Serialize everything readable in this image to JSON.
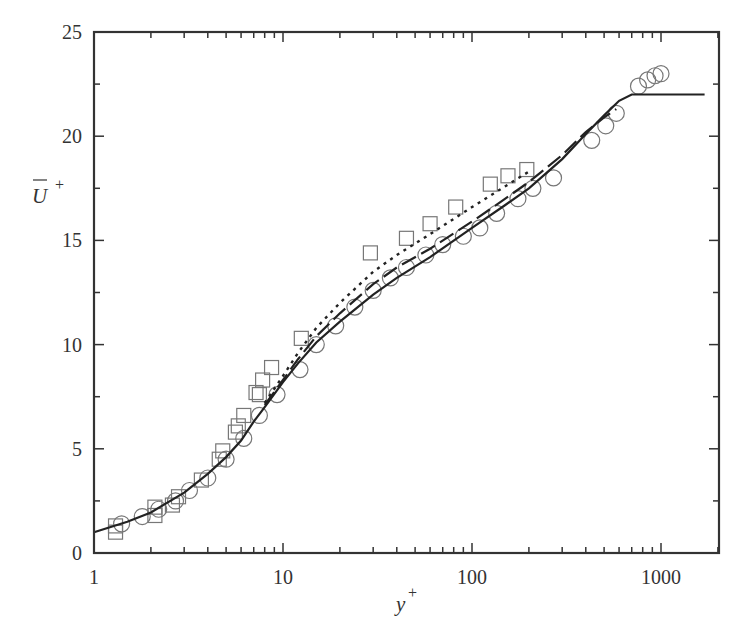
{
  "chart_data": {
    "type": "scatter",
    "title": "",
    "xlabel": "y+",
    "ylabel": "U+ (mean, overbar)",
    "x_scale": "log",
    "xlim": [
      1,
      2000
    ],
    "ylim": [
      0,
      25
    ],
    "x_ticks": [
      1,
      10,
      100,
      1000
    ],
    "x_tick_labels": [
      "1",
      "10",
      "100",
      "1000"
    ],
    "y_ticks": [
      0,
      5,
      10,
      15,
      20,
      25
    ],
    "y_tick_labels": [
      "0",
      "5",
      "10",
      "15",
      "20",
      "25"
    ],
    "grid": false,
    "legend": "none",
    "series": [
      {
        "name": "circles",
        "style": "open-circle",
        "points": [
          [
            1.4,
            1.4
          ],
          [
            1.8,
            1.75
          ],
          [
            2.2,
            2.1
          ],
          [
            2.7,
            2.5
          ],
          [
            3.2,
            3.0
          ],
          [
            4.0,
            3.6
          ],
          [
            5.0,
            4.5
          ],
          [
            6.2,
            5.5
          ],
          [
            7.5,
            6.6
          ],
          [
            9.3,
            7.6
          ],
          [
            12.3,
            8.8
          ],
          [
            15,
            10.0
          ],
          [
            19,
            10.9
          ],
          [
            24,
            11.8
          ],
          [
            30,
            12.6
          ],
          [
            37,
            13.2
          ],
          [
            45,
            13.7
          ],
          [
            57,
            14.3
          ],
          [
            70,
            14.8
          ],
          [
            90,
            15.2
          ],
          [
            110,
            15.6
          ],
          [
            135,
            16.3
          ],
          [
            175,
            17.0
          ],
          [
            210,
            17.5
          ],
          [
            270,
            18.0
          ],
          [
            430,
            19.8
          ],
          [
            510,
            20.5
          ],
          [
            580,
            21.1
          ],
          [
            760,
            22.4
          ],
          [
            850,
            22.7
          ],
          [
            930,
            22.9
          ],
          [
            1000,
            23.0
          ]
        ]
      },
      {
        "name": "squares",
        "style": "open-square",
        "points": [
          [
            1.3,
            1.0
          ],
          [
            1.3,
            1.3
          ],
          [
            2.1,
            1.8
          ],
          [
            2.1,
            2.2
          ],
          [
            2.6,
            2.3
          ],
          [
            2.8,
            2.7
          ],
          [
            3.7,
            3.5
          ],
          [
            4.6,
            4.5
          ],
          [
            4.8,
            4.9
          ],
          [
            5.6,
            5.8
          ],
          [
            5.8,
            6.1
          ],
          [
            6.2,
            6.6
          ],
          [
            7.2,
            7.7
          ],
          [
            7.5,
            7.6
          ],
          [
            7.8,
            8.3
          ],
          [
            8.7,
            8.9
          ],
          [
            12.5,
            10.3
          ],
          [
            29,
            14.4
          ],
          [
            45,
            15.1
          ],
          [
            60,
            15.8
          ],
          [
            82,
            16.6
          ],
          [
            125,
            17.7
          ],
          [
            155,
            18.1
          ],
          [
            195,
            18.4
          ]
        ]
      },
      {
        "name": "solid-line",
        "style": "solid",
        "points": [
          [
            1,
            1.0
          ],
          [
            1.5,
            1.5
          ],
          [
            2,
            1.95
          ],
          [
            3,
            2.9
          ],
          [
            4,
            3.8
          ],
          [
            5,
            4.6
          ],
          [
            6,
            5.4
          ],
          [
            7,
            6.3
          ],
          [
            8,
            7.0
          ],
          [
            10,
            8.2
          ],
          [
            12,
            9.1
          ],
          [
            15,
            10.1
          ],
          [
            20,
            11.1
          ],
          [
            30,
            12.4
          ],
          [
            40,
            13.2
          ],
          [
            60,
            14.2
          ],
          [
            100,
            15.6
          ],
          [
            150,
            16.7
          ],
          [
            200,
            17.5
          ],
          [
            300,
            18.9
          ],
          [
            400,
            20.1
          ],
          [
            500,
            21.0
          ],
          [
            600,
            21.7
          ],
          [
            700,
            22.0
          ],
          [
            1000,
            22.0
          ],
          [
            1700,
            22.0
          ]
        ]
      },
      {
        "name": "dashed-line",
        "style": "dashed",
        "points": [
          [
            8,
            7.1
          ],
          [
            10,
            8.3
          ],
          [
            12,
            9.3
          ],
          [
            15,
            10.4
          ],
          [
            20,
            11.5
          ],
          [
            30,
            12.9
          ],
          [
            40,
            13.7
          ],
          [
            60,
            14.6
          ],
          [
            100,
            15.9
          ],
          [
            150,
            17.0
          ],
          [
            200,
            17.8
          ],
          [
            300,
            19.1
          ],
          [
            400,
            20.2
          ],
          [
            500,
            20.9
          ],
          [
            580,
            21.3
          ]
        ]
      },
      {
        "name": "dotted-line",
        "style": "dotted",
        "points": [
          [
            8,
            7.2
          ],
          [
            10,
            8.5
          ],
          [
            12,
            9.6
          ],
          [
            15,
            10.8
          ],
          [
            20,
            12.0
          ],
          [
            30,
            13.5
          ],
          [
            40,
            14.3
          ],
          [
            60,
            15.3
          ],
          [
            100,
            16.6
          ],
          [
            150,
            17.6
          ],
          [
            200,
            18.3
          ]
        ]
      }
    ]
  },
  "layout": {
    "plot_left": 94,
    "plot_right": 719,
    "plot_top": 32,
    "plot_bottom": 553,
    "px_per_decade": 189,
    "line_color": "#222222",
    "marker_color": "#777777",
    "frame_color": "#333333"
  }
}
